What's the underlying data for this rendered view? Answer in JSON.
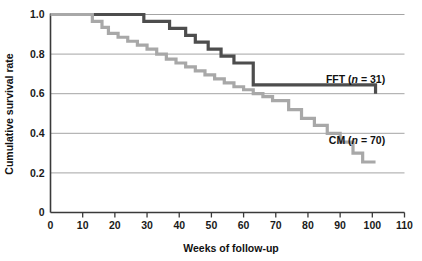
{
  "chart_data": {
    "type": "line",
    "title": "",
    "subtitle": "",
    "xlabel": "Weeks of follow-up",
    "ylabel": "Cumulative survival rate",
    "xlim": [
      0,
      110
    ],
    "ylim": [
      0,
      1.0
    ],
    "xticks": [
      0,
      10,
      20,
      30,
      40,
      50,
      60,
      70,
      80,
      90,
      100,
      110
    ],
    "xtick_labels": [
      "0",
      "10",
      "20",
      "30",
      "40",
      "50",
      "60",
      "70",
      "80",
      "90",
      "100",
      "110"
    ],
    "yticks": [
      0,
      0.2,
      0.4,
      0.6,
      0.8,
      1.0
    ],
    "ytick_labels": [
      "0",
      "0.2",
      "0.4",
      "0.6",
      "0.8",
      "1.0"
    ],
    "grid": "horizontal",
    "legend_position": "inline-right",
    "step_style": "post",
    "series": [
      {
        "name": "FFT",
        "label": "FFT (n = 31)",
        "label_text": "FFT",
        "label_n": "n",
        "label_eq": " = 31)",
        "n": 31,
        "color": "#4d4d4d",
        "line_width": 3.2,
        "label_x": 104,
        "label_y": 0.655,
        "x": [
          0,
          28,
          29,
          36,
          37,
          41,
          42,
          44,
          45,
          48,
          49,
          52,
          53,
          56,
          57,
          62,
          63,
          92,
          101
        ],
        "y": [
          1.0,
          1.0,
          0.965,
          0.965,
          0.93,
          0.93,
          0.895,
          0.895,
          0.86,
          0.86,
          0.825,
          0.825,
          0.79,
          0.79,
          0.755,
          0.755,
          0.645,
          0.645,
          0.6
        ]
      },
      {
        "name": "CM",
        "label": "CM (n = 70)",
        "label_text": "CM",
        "label_n": "n",
        "label_eq": " = 70)",
        "n": 70,
        "color": "#a8a8a8",
        "line_width": 3.2,
        "label_x": 104,
        "label_y": 0.345,
        "x": [
          0,
          12,
          13,
          15,
          16,
          17,
          18,
          20,
          21,
          23,
          24,
          26,
          27,
          29,
          30,
          32,
          33,
          35,
          36,
          38,
          39,
          41,
          42,
          44,
          45,
          47,
          48,
          50,
          51,
          53,
          54,
          56,
          57,
          59,
          60,
          62,
          63,
          65,
          66,
          68,
          69,
          73,
          74,
          77,
          78,
          81,
          82,
          85,
          86,
          89,
          90,
          93,
          94,
          96,
          97,
          101
        ],
        "y": [
          1.0,
          1.0,
          0.965,
          0.965,
          0.935,
          0.935,
          0.905,
          0.905,
          0.885,
          0.885,
          0.865,
          0.865,
          0.845,
          0.845,
          0.825,
          0.825,
          0.8,
          0.8,
          0.775,
          0.775,
          0.755,
          0.755,
          0.735,
          0.735,
          0.715,
          0.715,
          0.695,
          0.695,
          0.675,
          0.675,
          0.655,
          0.655,
          0.635,
          0.635,
          0.62,
          0.62,
          0.6,
          0.6,
          0.585,
          0.585,
          0.565,
          0.565,
          0.52,
          0.52,
          0.475,
          0.475,
          0.44,
          0.44,
          0.4,
          0.4,
          0.355,
          0.355,
          0.3,
          0.3,
          0.255,
          0.255
        ]
      }
    ]
  },
  "axes": {
    "y_title": "Cumulative survival rate",
    "x_title": "Weeks of follow-up"
  },
  "colors": {
    "axis": "#3a3a3a",
    "grid": "#9a9a9a",
    "text": "#111111",
    "fft": "#4d4d4d",
    "cm": "#a8a8a8",
    "background": "#ffffff"
  }
}
